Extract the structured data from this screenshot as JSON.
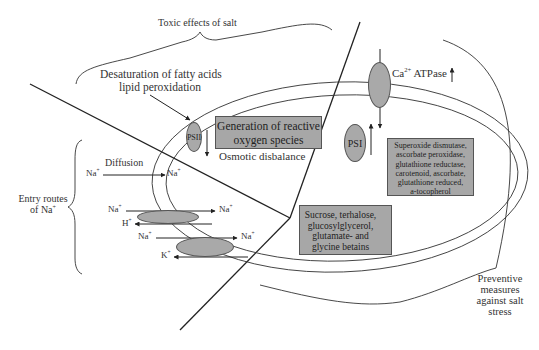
{
  "title": "Toxic effects of salt",
  "labels": {
    "toxic_effects": "Toxic effects of salt",
    "desaturation_line1": "Desaturation of fatty acids",
    "desaturation_line2": "lipid peroxidation",
    "ros_line1": "Generation of reactive",
    "ros_line2": "oxygen species",
    "osmotic": "Osmotic disbalance",
    "psii": "PSII",
    "psi": "PSI",
    "ca_atpase": "Ca",
    "ca_sup": "2+",
    "ca_atpase_suffix": " ATPase",
    "diffusion": "Diffusion",
    "entry_routes_line1": "Entry routes",
    "entry_routes_line2": "of Na",
    "entry_routes_sup": "+",
    "preventive_line1": "Preventive",
    "preventive_line2": "measures",
    "preventive_line3": "against salt",
    "preventive_line4": "stress"
  },
  "ions": {
    "na": "Na",
    "h": "H",
    "k": "K",
    "plus": "+"
  },
  "antioxidants_box": [
    "Superoxide dismutase,",
    "ascorbate peroxidase,",
    "glutathione reductase,",
    "carotenoid, ascorbate,",
    "glutathione reduced,",
    "a-tocopherol"
  ],
  "osmolytes_box": [
    "Sucrose, terhalose,",
    "glucosylglycerol,",
    "glutamate- and",
    "glycine betains"
  ],
  "colors": {
    "box_fill": "#a7a7a7",
    "line": "#222222",
    "background": "#ffffff"
  }
}
